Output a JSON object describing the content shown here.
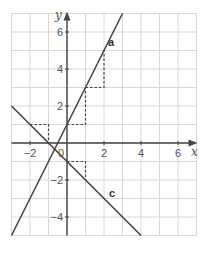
{
  "chart_data": {
    "type": "line",
    "title": "",
    "xlabel": "x",
    "ylabel": "y",
    "xlim": [
      -3,
      7
    ],
    "ylim": [
      -5,
      7
    ],
    "grid": true,
    "grid_step": 1,
    "x_ticks": [
      -2,
      2,
      4,
      6
    ],
    "y_ticks": [
      6,
      4,
      2,
      -2,
      -4
    ],
    "origin_label": "0",
    "series": [
      {
        "name": "a",
        "equation": "y = 2x + 1",
        "points": [
          [
            -3,
            -5
          ],
          [
            0,
            1
          ],
          [
            1,
            3
          ],
          [
            2,
            5
          ],
          [
            3,
            7
          ]
        ],
        "slope_triangles": [
          {
            "run_from": [
              0,
              1
            ],
            "run_to": [
              1,
              1
            ],
            "rise_to": [
              1,
              3
            ]
          },
          {
            "run_from": [
              1,
              3
            ],
            "run_to": [
              2,
              3
            ],
            "rise_to": [
              2,
              5
            ]
          }
        ]
      },
      {
        "name": "c",
        "equation": "y = -x - 1",
        "points": [
          [
            -3,
            2
          ],
          [
            -2,
            1
          ],
          [
            0,
            -1
          ],
          [
            1,
            -2
          ],
          [
            4,
            -5
          ]
        ],
        "slope_triangles": [
          {
            "run_from": [
              -2,
              1
            ],
            "run_to": [
              -1,
              1
            ],
            "rise_to": [
              -1,
              0
            ]
          },
          {
            "run_from": [
              0,
              -1
            ],
            "run_to": [
              1,
              -1
            ],
            "rise_to": [
              1,
              -2
            ]
          }
        ]
      }
    ],
    "legend": "inline labels",
    "colors": {
      "line": "#444444",
      "grid": "#d8d8d8",
      "axis": "#444444",
      "dashed": "#444444"
    }
  },
  "labels": {
    "x_axis": "x",
    "y_axis": "y",
    "origin": "0",
    "x_ticks": [
      "−2",
      "2",
      "4",
      "6"
    ],
    "y_ticks": [
      "6",
      "4",
      "2",
      "−2",
      "−4"
    ],
    "line_a": "a",
    "line_c": "c"
  }
}
